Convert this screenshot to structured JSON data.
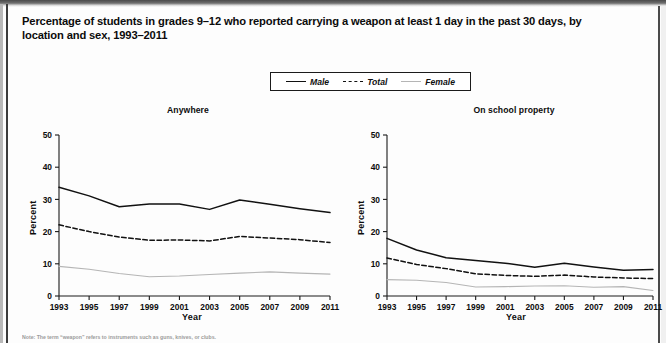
{
  "document": {
    "title_line1": "Percentage of students in grades 9–12 who reported carrying a weapon at least 1 day in the past 30 days, by location and sex,",
    "title_line2": "1993–2011",
    "note": "Note: The term “weapon” refers to instruments such as guns, knives, or clubs."
  },
  "legend": {
    "position": "top-center",
    "items": [
      {
        "label": "Male",
        "style": "solid",
        "color": "#111111"
      },
      {
        "label": "Total",
        "style": "dashed",
        "color": "#111111"
      },
      {
        "label": "Female",
        "style": "solid",
        "color": "#b5b5b5"
      }
    ]
  },
  "chart_data": [
    {
      "type": "line",
      "title": "Anywhere",
      "xlabel": "Year",
      "ylabel": "Percent",
      "x": [
        1993,
        1995,
        1997,
        1999,
        2001,
        2003,
        2005,
        2007,
        2009,
        2011
      ],
      "xticks": [
        "1993",
        "1995",
        "1997",
        "1999",
        "2001",
        "2003",
        "2005",
        "2007",
        "2009",
        "2011"
      ],
      "yticks": [
        "0",
        "10",
        "20",
        "30",
        "40",
        "50"
      ],
      "ylim": [
        0,
        50
      ],
      "grid": false,
      "series": [
        {
          "name": "Male",
          "color": "#111111",
          "style": "solid",
          "values": [
            33.8,
            31.1,
            27.7,
            28.6,
            28.6,
            26.9,
            29.8,
            28.5,
            27.1,
            25.9
          ]
        },
        {
          "name": "Total",
          "color": "#111111",
          "style": "dashed",
          "values": [
            22.1,
            20.0,
            18.3,
            17.3,
            17.4,
            17.1,
            18.5,
            18.0,
            17.5,
            16.6
          ]
        },
        {
          "name": "Female",
          "color": "#b5b5b5",
          "style": "solid",
          "values": [
            9.2,
            8.3,
            7.0,
            6.0,
            6.2,
            6.7,
            7.1,
            7.5,
            7.1,
            6.8
          ]
        }
      ]
    },
    {
      "type": "line",
      "title": "On school property",
      "xlabel": "Year",
      "ylabel": "Percent",
      "x": [
        1993,
        1995,
        1997,
        1999,
        2001,
        2003,
        2005,
        2007,
        2009,
        2011
      ],
      "xticks": [
        "1993",
        "1995",
        "1997",
        "1999",
        "2001",
        "2003",
        "2005",
        "2007",
        "2009",
        "2011"
      ],
      "yticks": [
        "0",
        "10",
        "20",
        "30",
        "40",
        "50"
      ],
      "ylim": [
        0,
        50
      ],
      "grid": false,
      "series": [
        {
          "name": "Male",
          "color": "#111111",
          "style": "solid",
          "values": [
            17.9,
            14.3,
            11.9,
            11.0,
            10.2,
            8.9,
            10.2,
            9.0,
            8.0,
            8.2
          ]
        },
        {
          "name": "Total",
          "color": "#111111",
          "style": "dashed",
          "values": [
            11.8,
            9.8,
            8.5,
            6.9,
            6.4,
            6.1,
            6.5,
            5.9,
            5.6,
            5.4
          ]
        },
        {
          "name": "Female",
          "color": "#b5b5b5",
          "style": "solid",
          "values": [
            5.1,
            4.9,
            4.2,
            2.8,
            2.9,
            3.1,
            3.2,
            2.7,
            2.9,
            1.7
          ]
        }
      ]
    }
  ]
}
